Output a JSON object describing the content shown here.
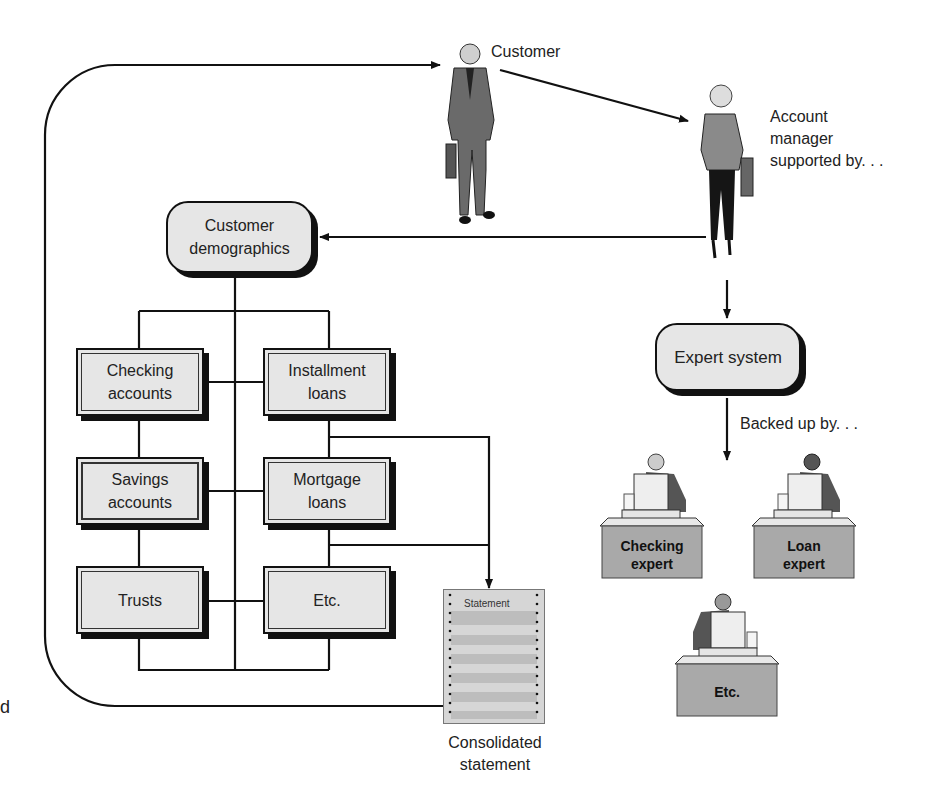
{
  "diagram": {
    "actors": {
      "customer": {
        "label": "Customer"
      },
      "account_manager": {
        "label_lines": [
          "Account",
          "manager",
          "supported by. . ."
        ]
      }
    },
    "nodes": {
      "customer_demographics": {
        "label_lines": [
          "Customer",
          "demographics"
        ]
      },
      "expert_system": {
        "label": "Expert system"
      },
      "products": [
        {
          "id": "checking",
          "label_lines": [
            "Checking",
            "accounts"
          ]
        },
        {
          "id": "installment",
          "label_lines": [
            "Installment",
            "loans"
          ]
        },
        {
          "id": "savings",
          "label_lines": [
            "Savings",
            "accounts"
          ]
        },
        {
          "id": "mortgage",
          "label_lines": [
            "Mortgage",
            "loans"
          ]
        },
        {
          "id": "trusts",
          "label_lines": [
            "Trusts"
          ]
        },
        {
          "id": "etc",
          "label_lines": [
            "Etc."
          ]
        }
      ],
      "statement": {
        "doc_title": "Statement",
        "caption_lines": [
          "Consolidated",
          "statement"
        ]
      }
    },
    "edge_labels": {
      "backed_up": "Backed up by. . ."
    },
    "experts": [
      {
        "label_lines": [
          "Checking",
          "expert"
        ]
      },
      {
        "label_lines": [
          "Loan",
          "expert"
        ]
      },
      {
        "label_lines": [
          "Etc."
        ]
      }
    ],
    "cropped_left_text": "d",
    "colors": {
      "line": "#111111",
      "box_fill": "#e6e6e6",
      "desk_fill": "#a9a9a9",
      "statement_fill": "#d6d6d6",
      "statement_band": "#bdbdbd"
    }
  }
}
